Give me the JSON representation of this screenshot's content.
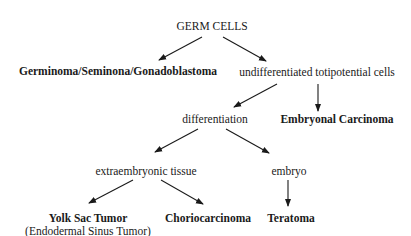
{
  "diagram": {
    "type": "flowchart",
    "nodes": {
      "root": "GERM CELLS",
      "germinoma": "Germinoma/Seminona/Gonadoblastoma",
      "undifferentiated": "undifferentiated totipotential cells",
      "differentiation": "differentiation",
      "embryonal": "Embryonal Carcinoma",
      "extraembryonic": "extraembryonic tissue",
      "embryo": "embryo",
      "yolk_sac": "Yolk Sac Tumor",
      "yolk_sac_alt": "(Endodermal Sinus Tumor)",
      "chorio": "Choriocarcinoma",
      "teratoma": "Teratoma"
    },
    "edges": [
      [
        "GERM CELLS",
        "Germinoma/Seminona/Gonadoblastoma"
      ],
      [
        "GERM CELLS",
        "undifferentiated totipotential cells"
      ],
      [
        "undifferentiated totipotential cells",
        "differentiation"
      ],
      [
        "undifferentiated totipotential cells",
        "Embryonal Carcinoma"
      ],
      [
        "differentiation",
        "extraembryonic tissue"
      ],
      [
        "differentiation",
        "embryo"
      ],
      [
        "extraembryonic tissue",
        "Yolk Sac Tumor"
      ],
      [
        "extraembryonic tissue",
        "Choriocarcinoma"
      ],
      [
        "embryo",
        "Teratoma"
      ]
    ]
  }
}
